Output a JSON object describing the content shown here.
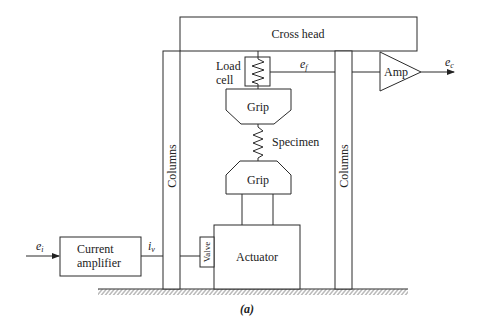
{
  "diagram": {
    "caption": "(a)",
    "blocks": {
      "cross_head": "Cross head",
      "load_cell_line1": "Load",
      "load_cell_line2": "cell",
      "grip_top": "Grip",
      "specimen": "Specimen",
      "grip_bottom": "Grip",
      "actuator": "Actuator",
      "valve": "Valve",
      "column_left": "Columns",
      "column_right": "Columns",
      "amp": "Amp",
      "current_amp_line1": "Current",
      "current_amp_line2": "amplifier"
    },
    "signals": {
      "input": "e",
      "input_sub": "i",
      "valve_current": "i",
      "valve_current_sub": "v",
      "load_signal": "e",
      "load_signal_sub": "f",
      "output": "e",
      "output_sub": "c"
    }
  }
}
